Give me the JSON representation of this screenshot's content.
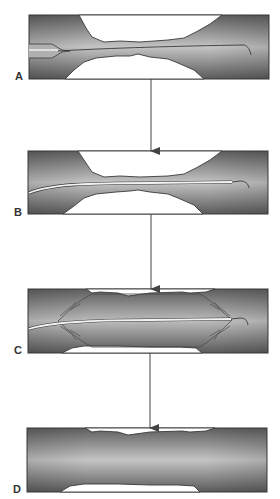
{
  "figure": {
    "colors": {
      "background": "#ffffff",
      "vessel_dark": "#5a5a5a",
      "vessel_light": "#bdbdbd",
      "plaque": "#ffffff",
      "outline": "#3a3a3a",
      "arrow": "#444444"
    },
    "panels": [
      {
        "id": "A",
        "label": "A",
        "stage": "guidewire crossing stenosis"
      },
      {
        "id": "B",
        "label": "B",
        "stage": "balloon catheter advanced over wire"
      },
      {
        "id": "C",
        "label": "C",
        "stage": "balloon inflated, plaque compressed"
      },
      {
        "id": "D",
        "label": "D",
        "stage": "vessel after dilation"
      }
    ],
    "arrows": [
      {
        "from": "A",
        "to": "B"
      },
      {
        "from": "B",
        "to": "C"
      },
      {
        "from": "C",
        "to": "D"
      }
    ]
  }
}
